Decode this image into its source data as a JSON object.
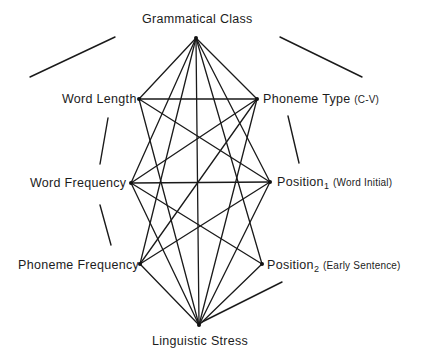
{
  "nodes": [
    {
      "id": "gc",
      "label": "Grammatical Class",
      "sub": "",
      "qualifier": "",
      "x": 196,
      "y": 38
    },
    {
      "id": "wl",
      "label": "Word Length",
      "sub": "",
      "qualifier": "",
      "x": 139,
      "y": 99
    },
    {
      "id": "pt",
      "label": "Phoneme Type",
      "sub": "",
      "qualifier": "(C-V)",
      "x": 257,
      "y": 99
    },
    {
      "id": "wf",
      "label": "Word Frequency",
      "sub": "",
      "qualifier": "",
      "x": 131,
      "y": 183
    },
    {
      "id": "p1",
      "label": "Position",
      "sub": "1",
      "qualifier": "(Word Initial)",
      "x": 270,
      "y": 182
    },
    {
      "id": "pf",
      "label": "Phoneme Frequency",
      "sub": "",
      "qualifier": "",
      "x": 140,
      "y": 264
    },
    {
      "id": "p2",
      "label": "Position",
      "sub": "2",
      "qualifier": "(Early Sentence)",
      "x": 262,
      "y": 264
    },
    {
      "id": "ls",
      "label": "Linguistic Stress",
      "sub": "",
      "qualifier": "",
      "x": 199,
      "y": 325
    }
  ],
  "edges": [
    [
      "gc",
      "wf"
    ],
    [
      "gc",
      "pf"
    ],
    [
      "gc",
      "ls"
    ],
    [
      "gc",
      "p1"
    ],
    [
      "gc",
      "p2"
    ],
    [
      "gc",
      "wl"
    ],
    [
      "gc",
      "pt"
    ],
    [
      "wl",
      "pt"
    ],
    [
      "wf",
      "p1"
    ],
    [
      "wl",
      "p1"
    ],
    [
      "wl",
      "ls"
    ],
    [
      "pt",
      "wf"
    ],
    [
      "pt",
      "pf"
    ],
    [
      "pt",
      "ls"
    ],
    [
      "wf",
      "p2"
    ],
    [
      "wf",
      "ls"
    ],
    [
      "p1",
      "pf"
    ],
    [
      "p1",
      "ls"
    ],
    [
      "pf",
      "ls"
    ],
    [
      "p2",
      "ls"
    ]
  ],
  "decorations": [
    {
      "x1": 30,
      "y1": 77,
      "x2": 115,
      "y2": 37
    },
    {
      "x1": 280,
      "y1": 37,
      "x2": 362,
      "y2": 77
    },
    {
      "x1": 108,
      "y1": 118,
      "x2": 100,
      "y2": 164
    },
    {
      "x1": 100,
      "y1": 205,
      "x2": 111,
      "y2": 245
    },
    {
      "x1": 288,
      "y1": 116,
      "x2": 299,
      "y2": 163
    },
    {
      "x1": 282,
      "y1": 282,
      "x2": 202,
      "y2": 322
    }
  ],
  "labels": {
    "gc": "Grammatical Class",
    "wl": "Word Length",
    "pt_main": "Phoneme Type",
    "pt_qual": "(C-V)",
    "wf": "Word Frequency",
    "p1_main": "Position",
    "p1_sub": "1",
    "p1_qual": "(Word Initial)",
    "pf": "Phoneme Frequency",
    "p2_main": "Position",
    "p2_sub": "2",
    "p2_qual": "(Early Sentence)",
    "ls": "Linguistic Stress"
  }
}
